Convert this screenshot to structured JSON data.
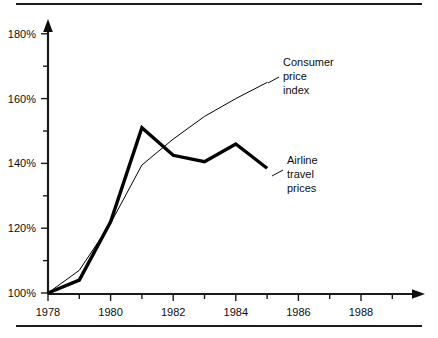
{
  "chart_data": {
    "type": "line",
    "title": "",
    "subtitle": "",
    "xlabel": "",
    "ylabel": "",
    "xlim": [
      1978,
      1989
    ],
    "ylim": [
      100,
      185
    ],
    "grid": false,
    "legend_position": "inline-annotations",
    "x_ticks": [
      1978,
      1979,
      1980,
      1981,
      1982,
      1983,
      1984,
      1985,
      1986,
      1987,
      1988,
      1989
    ],
    "x_tick_labels": [
      "1978",
      "",
      "1980",
      "",
      "1982",
      "",
      "1984",
      "",
      "1986",
      "",
      "1988",
      ""
    ],
    "y_ticks": [
      100,
      110,
      120,
      130,
      140,
      150,
      160,
      170,
      180
    ],
    "y_tick_labels": [
      "100%",
      "",
      "120%",
      "",
      "140%",
      "",
      "160%",
      "",
      "180%"
    ],
    "axis_style": "arrow-ended-left-and-bottom",
    "series": [
      {
        "name": "Consumer price index",
        "label_lines": [
          "Consumer",
          "price",
          "index"
        ],
        "style": "thin",
        "color": "#000000",
        "line_width": 1,
        "x": [
          1978,
          1979,
          1980,
          1981,
          1982,
          1983,
          1984,
          1985
        ],
        "values": [
          100,
          107,
          121.5,
          139.5,
          147.5,
          154.5,
          160,
          165
        ]
      },
      {
        "name": "Airline travel prices",
        "label_lines": [
          "Airline",
          "travel",
          "prices"
        ],
        "style": "thick",
        "color": "#000000",
        "line_width": 3.4,
        "x": [
          1978,
          1979,
          1980,
          1981,
          1982,
          1983,
          1984,
          1985
        ],
        "values": [
          100,
          104,
          122,
          151,
          142.5,
          140.5,
          146,
          138.5
        ]
      }
    ],
    "annotations": [
      {
        "name": "cpi-annotation",
        "text_lines": [
          "Consumer",
          "price",
          "index"
        ],
        "text_x": 283,
        "text_y": 62,
        "leader_from": [
          268,
          83
        ],
        "leader_to": [
          279,
          77
        ]
      },
      {
        "name": "airline-annotation",
        "text_lines": [
          "Airline",
          "travel",
          "prices"
        ],
        "text_x": 287,
        "text_y": 160,
        "leader_from": [
          272,
          176
        ],
        "leader_to": [
          283,
          170
        ]
      }
    ]
  },
  "y_axis": {
    "labels": [
      "180%",
      "160%",
      "140%",
      "120%",
      "100%"
    ]
  },
  "x_axis": {
    "labels": [
      "1978",
      "1980",
      "1982",
      "1984",
      "1986",
      "1988"
    ]
  },
  "series_labels": {
    "cpi": {
      "line1": "Consumer",
      "line2": "price",
      "line3": "index"
    },
    "airline": {
      "line1": "Airline",
      "line2": "travel",
      "line3": "prices"
    }
  }
}
